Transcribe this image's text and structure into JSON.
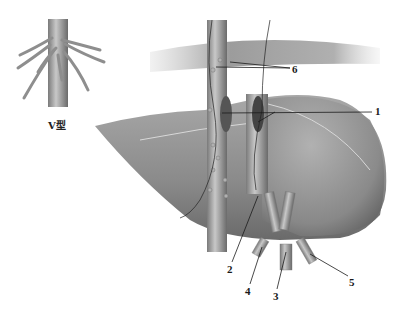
{
  "figure": {
    "inset_caption": "V型",
    "labels": [
      {
        "id": "1",
        "text": "1",
        "x": 375,
        "y": 106
      },
      {
        "id": "2",
        "text": "2",
        "x": 227,
        "y": 264
      },
      {
        "id": "3",
        "text": "3",
        "x": 273,
        "y": 291
      },
      {
        "id": "4",
        "text": "4",
        "x": 245,
        "y": 286
      },
      {
        "id": "5",
        "text": "5",
        "x": 349,
        "y": 277
      },
      {
        "id": "6",
        "text": "6",
        "x": 292,
        "y": 64
      }
    ],
    "colors": {
      "background": "#ffffff",
      "liver_light": "#b8b8b8",
      "liver_dark": "#6e6e6e",
      "vessel": "#9a9a9a",
      "line": "#1a1a1a"
    }
  }
}
